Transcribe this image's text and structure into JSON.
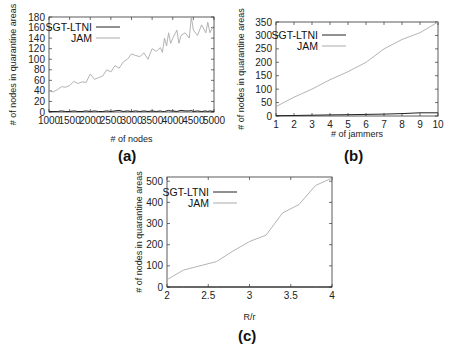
{
  "chart_data": [
    {
      "id": "a",
      "type": "line",
      "caption": "(a)",
      "title": "",
      "xlabel": "# of nodes",
      "ylabel": "# of nodes in quarantine areas",
      "xlim": [
        1000,
        5000
      ],
      "ylim": [
        0,
        180
      ],
      "xticks": [
        1000,
        1500,
        2000,
        2500,
        3000,
        3500,
        4000,
        4500,
        5000
      ],
      "yticks": [
        0,
        20,
        40,
        60,
        80,
        100,
        120,
        140,
        160,
        180
      ],
      "grid": false,
      "legend_position": "upper-left",
      "x": [
        1000,
        1100,
        1200,
        1300,
        1400,
        1500,
        1600,
        1700,
        1800,
        1900,
        2000,
        2100,
        2200,
        2300,
        2400,
        2500,
        2600,
        2700,
        2800,
        2900,
        3000,
        3100,
        3200,
        3300,
        3400,
        3500,
        3600,
        3700,
        3750,
        3800,
        3850,
        3900,
        3950,
        4000,
        4100,
        4150,
        4200,
        4300,
        4400,
        4450,
        4500,
        4600,
        4700,
        4800,
        4850,
        4900,
        5000
      ],
      "series": [
        {
          "name": "SGT-LTNI",
          "color": "#222222",
          "values": [
            1,
            1,
            1,
            2,
            1,
            1,
            2,
            1,
            1,
            2,
            1,
            2,
            1,
            1,
            2,
            1,
            2,
            3,
            1,
            2,
            1,
            2,
            1,
            2,
            1,
            2,
            1,
            2,
            1,
            1,
            2,
            3,
            2,
            2,
            1,
            2,
            3,
            2,
            2,
            3,
            1,
            2,
            1,
            2,
            1,
            2,
            1
          ]
        },
        {
          "name": "JAM",
          "color": "#aaaaaa",
          "values": [
            40,
            38,
            42,
            48,
            47,
            50,
            58,
            54,
            57,
            56,
            72,
            62,
            65,
            68,
            80,
            76,
            88,
            83,
            95,
            100,
            110,
            107,
            105,
            112,
            100,
            120,
            115,
            122,
            113,
            140,
            125,
            150,
            130,
            140,
            155,
            130,
            145,
            150,
            140,
            180,
            155,
            145,
            165,
            150,
            170,
            150,
            165
          ]
        }
      ]
    },
    {
      "id": "b",
      "type": "line",
      "caption": "(b)",
      "title": "",
      "xlabel": "# of jammers",
      "ylabel": "# of nodes in quarantine areas",
      "xlim": [
        1,
        10
      ],
      "ylim": [
        0,
        350
      ],
      "xticks": [
        1,
        2,
        3,
        4,
        5,
        6,
        7,
        8,
        9,
        10
      ],
      "yticks": [
        0,
        50,
        100,
        150,
        200,
        250,
        300,
        350
      ],
      "grid": false,
      "legend_position": "upper-left",
      "x": [
        1,
        2,
        3,
        4,
        5,
        6,
        7,
        8,
        9,
        10
      ],
      "series": [
        {
          "name": "SGT-LTNI",
          "color": "#222222",
          "values": [
            1,
            2,
            3,
            4,
            5,
            6,
            7,
            9,
            12,
            12
          ]
        },
        {
          "name": "JAM",
          "color": "#aaaaaa",
          "values": [
            35,
            70,
            100,
            135,
            165,
            200,
            250,
            285,
            310,
            350
          ]
        }
      ]
    },
    {
      "id": "c",
      "type": "line",
      "caption": "(c)",
      "title": "",
      "xlabel": "R/r",
      "ylabel": "# of nodes in quarantine areas",
      "xlim": [
        2,
        4
      ],
      "ylim": [
        0,
        520
      ],
      "xticks": [
        2,
        2.5,
        3,
        3.5,
        4
      ],
      "yticks": [
        0,
        100,
        200,
        300,
        400,
        500
      ],
      "grid": false,
      "legend_position": "upper-left",
      "x": [
        2,
        2.2,
        2.4,
        2.6,
        2.8,
        3.0,
        3.2,
        3.4,
        3.6,
        3.8,
        4.0
      ],
      "series": [
        {
          "name": "SGT-LTNI",
          "color": "#222222",
          "values": [
            0,
            0,
            0,
            0,
            0,
            0,
            0,
            0,
            0,
            0,
            0
          ]
        },
        {
          "name": "JAM",
          "color": "#aaaaaa",
          "values": [
            35,
            80,
            100,
            120,
            170,
            215,
            245,
            350,
            390,
            480,
            515
          ]
        }
      ]
    }
  ]
}
